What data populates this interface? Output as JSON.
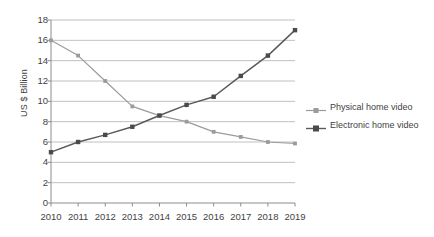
{
  "chart_data": {
    "type": "line",
    "title": "",
    "xlabel": "",
    "ylabel": "US $ Billion",
    "categories": [
      "2010",
      "2011",
      "2012",
      "2013",
      "2014",
      "2015",
      "2016",
      "2017",
      "2018",
      "2019"
    ],
    "x": [
      2010,
      2011,
      2012,
      2013,
      2014,
      2015,
      2016,
      2017,
      2018,
      2019
    ],
    "ylim": [
      0,
      18
    ],
    "ytick_labels": [
      "0",
      "2",
      "4",
      "6",
      "8",
      "10",
      "12",
      "14",
      "16",
      "18"
    ],
    "ytick_values": [
      0,
      2,
      4,
      6,
      8,
      10,
      12,
      14,
      16,
      18
    ],
    "grid": true,
    "grid_axis": "y",
    "legend_position": "right",
    "series": [
      {
        "name": "Physical home video",
        "color": "#9b9b9b",
        "marker": "square",
        "values": [
          16.0,
          14.5,
          12.0,
          9.5,
          8.6,
          8.0,
          7.0,
          6.5,
          6.0,
          5.85
        ]
      },
      {
        "name": "Electronic home video",
        "color": "#5a5a5a",
        "marker": "square",
        "values": [
          5.0,
          6.0,
          6.7,
          7.5,
          8.6,
          9.65,
          10.45,
          12.5,
          14.5,
          17.0
        ]
      }
    ]
  },
  "style": {
    "background": "#ffffff",
    "grid_color": "#b0b0b0",
    "axis_color": "#8c8c8c",
    "text_color": "#3f3f3f"
  },
  "geometry": {
    "plot_left": 51,
    "plot_right": 295,
    "plot_top": 20,
    "plot_bottom": 203,
    "x_label_y": 212
  }
}
